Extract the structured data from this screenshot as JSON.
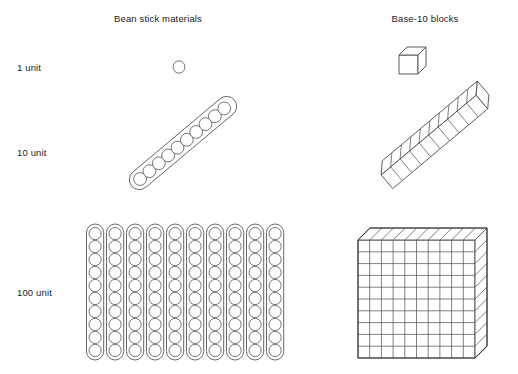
{
  "figure": {
    "title_visible": false,
    "background_color": "#ffffff",
    "line_color": "#55555a"
  },
  "columns": [
    {
      "key": "bean",
      "label": "Bean stick materials"
    },
    {
      "key": "base10",
      "label": "Base-10 blocks"
    }
  ],
  "rows": [
    {
      "key": "one",
      "label": "1 unit"
    },
    {
      "key": "ten",
      "label": "10 unit"
    },
    {
      "key": "hundred",
      "label": "100 unit"
    }
  ],
  "chart_data": {
    "type": "diagram",
    "column_headers": [
      "Bean stick materials",
      "Base-10 blocks"
    ],
    "row_headers": [
      "1 unit",
      "10 unit",
      "100 unit"
    ],
    "cells": [
      {
        "row": "1 unit",
        "column": "Bean stick materials",
        "icon": "single-bean-circle",
        "quantity": 1,
        "shape": "circle",
        "sticks": 0,
        "beans_per_stick": 0
      },
      {
        "row": "1 unit",
        "column": "Base-10 blocks",
        "icon": "unit-cube",
        "quantity": 1,
        "shape": "isometric-cube",
        "cubes": 1
      },
      {
        "row": "10 unit",
        "column": "Bean stick materials",
        "icon": "bean-stick-of-ten",
        "quantity": 10,
        "shape": "diagonal-capsule-with-circles",
        "sticks": 1,
        "beans_per_stick": 10,
        "rotation_degrees": -40
      },
      {
        "row": "10 unit",
        "column": "Base-10 blocks",
        "icon": "rod-of-ten",
        "quantity": 10,
        "shape": "diagonal-isometric-rod",
        "cubes": 10,
        "rotation_degrees": -40
      },
      {
        "row": "100 unit",
        "column": "Bean stick materials",
        "icon": "ten-bean-sticks-array",
        "quantity": 100,
        "shape": "vertical-capsule-array",
        "sticks": 10,
        "beans_per_stick": 10
      },
      {
        "row": "100 unit",
        "column": "Base-10 blocks",
        "icon": "hundred-flat",
        "quantity": 100,
        "shape": "isometric-flat-grid",
        "grid_rows": 10,
        "grid_columns": 10
      }
    ],
    "legend": [],
    "grid": false
  }
}
